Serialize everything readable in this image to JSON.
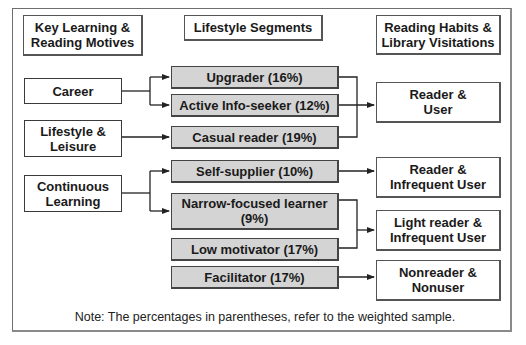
{
  "headers": {
    "left": "Key Learning &\nReading Motives",
    "middle": "Lifestyle Segments",
    "right": "Reading Habits &\nLibrary Visitations"
  },
  "motives": [
    {
      "label": "Career"
    },
    {
      "label": "Lifestyle &\nLeisure"
    },
    {
      "label": "Continuous\nLearning"
    }
  ],
  "segments": [
    {
      "label": "Upgrader (16%)",
      "name": "Upgrader",
      "percent": 16
    },
    {
      "label": "Active Info-seeker (12%)",
      "name": "Active Info-seeker",
      "percent": 12
    },
    {
      "label": "Casual reader (19%)",
      "name": "Casual reader",
      "percent": 19
    },
    {
      "label": "Self-supplier (10%)",
      "name": "Self-supplier",
      "percent": 10
    },
    {
      "label": "Narrow-focused learner\n(9%)",
      "name": "Narrow-focused learner",
      "percent": 9
    },
    {
      "label": "Low motivator (17%)",
      "name": "Low motivator",
      "percent": 17
    },
    {
      "label": "Facilitator (17%)",
      "name": "Facilitator",
      "percent": 17
    }
  ],
  "outcomes": [
    {
      "label": "Reader &\nUser"
    },
    {
      "label": "Reader &\nInfrequent User"
    },
    {
      "label": "Light reader &\nInfrequent User"
    },
    {
      "label": "Nonreader &\nNonuser"
    }
  ],
  "edges": [
    {
      "from": "Career",
      "to": "Upgrader"
    },
    {
      "from": "Career",
      "to": "Active Info-seeker"
    },
    {
      "from": "Lifestyle & Leisure",
      "to": "Casual reader"
    },
    {
      "from": "Continuous Learning",
      "to": "Self-supplier"
    },
    {
      "from": "Continuous Learning",
      "to": "Narrow-focused learner"
    },
    {
      "from": "Upgrader",
      "to": "Reader & User"
    },
    {
      "from": "Active Info-seeker",
      "to": "Reader & User"
    },
    {
      "from": "Casual reader",
      "to": "Reader & User"
    },
    {
      "from": "Self-supplier",
      "to": "Reader & Infrequent User"
    },
    {
      "from": "Narrow-focused learner",
      "to": "Light reader & Infrequent User"
    },
    {
      "from": "Low motivator",
      "to": "Light reader & Infrequent User"
    },
    {
      "from": "Facilitator",
      "to": "Nonreader & Nonuser"
    }
  ],
  "note": "Note: The percentages in parentheses, refer to the weighted sample.",
  "colors": {
    "segment_fill": "#d4d4d4",
    "border": "#3a3a3a",
    "background": "#ffffff"
  }
}
